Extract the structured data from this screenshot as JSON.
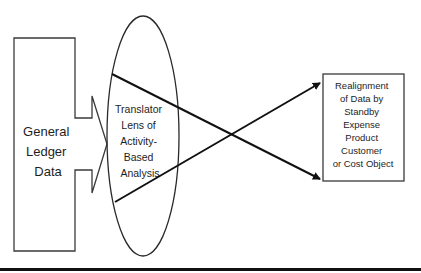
{
  "diagram": {
    "source_block": {
      "lines": [
        "General",
        "Ledger",
        "Data"
      ]
    },
    "lens": {
      "lines": [
        "Translator",
        "Lens of",
        "Activity-",
        "Based",
        "Analysis"
      ]
    },
    "target_block": {
      "lines": [
        "Realignment",
        "of Data by",
        "Standby",
        "Expense",
        "Product",
        "Customer",
        "or Cost Object"
      ]
    },
    "colors": {
      "stroke": "#2a2a2a",
      "background": "#ffffff",
      "text": "#1e1e1e"
    }
  }
}
